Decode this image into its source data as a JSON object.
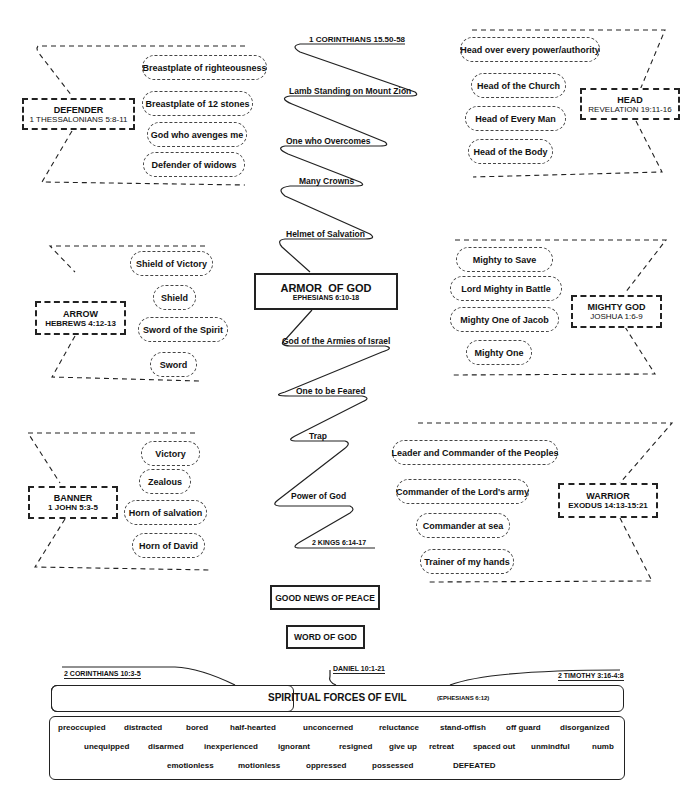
{
  "center": {
    "title": "ARMOR  OF GOD",
    "ref": "EPHESIANS 6:10-18",
    "zigzag_top_ref": "1 CORINTHIANS 15.50-58",
    "zigzag_items_upper": [
      "Lamb Standing on Mount Zion",
      "One who Overcomes",
      "Many Crowns",
      "Helmet of Salvation"
    ],
    "zigzag_items_lower": [
      "God of the Armies of Israel",
      "One to be Feared",
      "Trap",
      "Power of God"
    ],
    "zigzag_bottom_ref": "2 KINGS 6:14-17",
    "boxes": [
      "GOOD NEWS OF PEACE",
      "WORD OF GOD"
    ]
  },
  "groups": {
    "defender": {
      "title": "DEFENDER",
      "ref": "1 THESSALONIANS 5:8-11",
      "items": [
        "Breastplate of righteousness",
        "Breastplate of 12 stones",
        "God who avenges me",
        "Defender of widows"
      ]
    },
    "head": {
      "title": "HEAD",
      "ref": "REVELATION 19:11-16",
      "items": [
        "Head over every power/authority",
        "Head of the Church",
        "Head of Every Man",
        "Head of the Body"
      ]
    },
    "arrow": {
      "title": "ARROW",
      "ref": "HEBREWS 4:12-13",
      "items": [
        "Shield of Victory",
        "Shield",
        "Sword of the Spirit",
        "Sword"
      ]
    },
    "mighty_god": {
      "title": "MIGHTY GOD",
      "ref": "JOSHUA 1:6-9",
      "items": [
        "Mighty to Save",
        "Lord Mighty in Battle",
        "Mighty One of Jacob",
        "Mighty One"
      ]
    },
    "banner": {
      "title": "BANNER",
      "ref": "1 JOHN 5:3-5",
      "items": [
        "Victory",
        "Zealous",
        "Horn of salvation",
        "Horn of David"
      ]
    },
    "warrior": {
      "title": "WARRIOR",
      "ref": "EXODUS 14:13-15:21",
      "items": [
        "Leader and Commander of the Peoples",
        "Commander of the Lord's army",
        "Commander at sea",
        "Trainer of my hands"
      ]
    }
  },
  "evil": {
    "refs": [
      "2 CORINTHIANS 10:3-5",
      "DANIEL 10:1-21",
      "2 TIMOTHY 3:16-4:8"
    ],
    "title": "SPIRITUAL FORCES OF EVIL",
    "title_ref": "(EPHESIANS 6:12)",
    "row1": [
      "preoccupied",
      "distracted",
      "bored",
      "half-hearted",
      "unconcerned",
      "reluctance",
      "stand-offish",
      "off guard",
      "disorganized"
    ],
    "row2": [
      "unequipped",
      "disarmed",
      "inexperienced",
      "ignorant",
      "resigned",
      "give up",
      "retreat",
      "spaced out",
      "unmindful",
      "numb"
    ],
    "row3": [
      "emotionless",
      "motionless",
      "oppressed",
      "possessed",
      "DEFEATED"
    ]
  }
}
